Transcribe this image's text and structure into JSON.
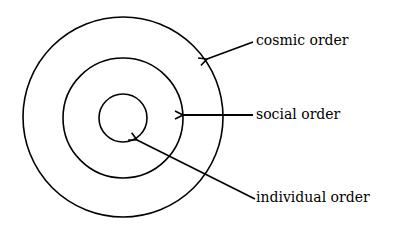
{
  "diagram": {
    "type": "concentric-circles",
    "center": [
      123,
      117
    ],
    "stroke_color": "#000000",
    "background": "#ffffff",
    "rings": [
      {
        "name": "outer",
        "radius": 100,
        "label": "cosmic order"
      },
      {
        "name": "middle",
        "radius": 60,
        "label": "social order"
      },
      {
        "name": "inner",
        "radius": 24,
        "label": "individual order"
      }
    ]
  },
  "labels": {
    "cosmic": "cosmic order",
    "social": "social order",
    "individual": "individual order"
  }
}
